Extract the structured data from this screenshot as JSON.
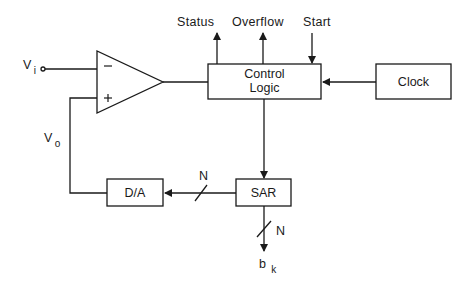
{
  "diagram": {
    "type": "block-diagram",
    "blocks": {
      "comparator": {
        "minus_sign": "−",
        "plus_sign": "+"
      },
      "control_logic": {
        "line1": "Control",
        "line2": "Logic"
      },
      "clock": {
        "label": "Clock"
      },
      "sar": {
        "label": "SAR"
      },
      "dac": {
        "label": "D/A"
      }
    },
    "signals": {
      "vi": {
        "main": "V",
        "sub": "i"
      },
      "vo": {
        "main": "V",
        "sub": "o"
      },
      "status": "Status",
      "overflow": "Overflow",
      "start": "Start",
      "bus_width_dac": "N",
      "bus_width_out": "N",
      "bk": {
        "main": "b",
        "sub": "k"
      }
    },
    "colors": {
      "line": "#1a1a1a",
      "background": "#ffffff"
    }
  }
}
